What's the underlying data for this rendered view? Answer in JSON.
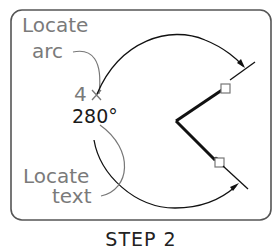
{
  "figure": {
    "title": "STEP 2",
    "callouts": {
      "locate_arc": {
        "line1": "Locate",
        "line2": "arc"
      },
      "locate_text": {
        "line1": "Locate",
        "line2": "text"
      }
    },
    "dimension": {
      "point_label": "4",
      "value": "280°"
    },
    "colors": {
      "frame": "#555555",
      "callout_text": "#7a7a7a",
      "geometry": "#111111",
      "grip_box": "#777777"
    }
  }
}
